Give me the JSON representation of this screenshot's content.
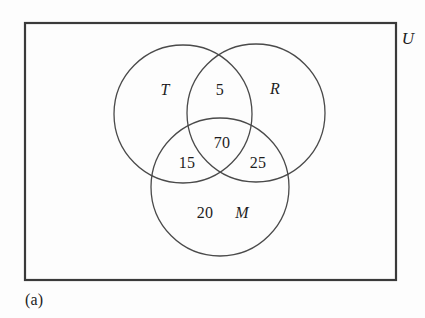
{
  "figure": {
    "caption": "(a)",
    "type": "venn-diagram-3-set",
    "stroke_color": "#3a3a3a",
    "text_color": "#1d1d1d",
    "background_color": "#fdfdfd"
  },
  "universe": {
    "label": "U",
    "rect": {
      "x": 25,
      "y": 23,
      "width": 371,
      "height": 257
    },
    "label_position": {
      "x": 408,
      "y": 38
    }
  },
  "sets": [
    {
      "key": "T",
      "label": "T",
      "circle": {
        "cx": 183,
        "cy": 114,
        "r": 69
      },
      "label_position": {
        "x": 165,
        "y": 90
      }
    },
    {
      "key": "R",
      "label": "R",
      "circle": {
        "cx": 256,
        "cy": 113,
        "r": 69
      },
      "label_position": {
        "x": 275,
        "y": 89
      }
    },
    {
      "key": "M",
      "label": "M",
      "circle": {
        "cx": 220,
        "cy": 187,
        "r": 69
      },
      "label_position": {
        "x": 242,
        "y": 213
      }
    }
  ],
  "regions": [
    {
      "key": "T_only_R",
      "label": "5",
      "region": "T ∩ R only",
      "position": {
        "x": 220,
        "y": 90
      }
    },
    {
      "key": "T_R_M",
      "label": "70",
      "region": "T ∩ R ∩ M",
      "position": {
        "x": 222,
        "y": 143
      }
    },
    {
      "key": "T_M",
      "label": "15",
      "region": "T ∩ M only",
      "position": {
        "x": 187,
        "y": 163
      }
    },
    {
      "key": "R_M",
      "label": "25",
      "region": "R ∩ M only",
      "position": {
        "x": 258,
        "y": 163
      }
    },
    {
      "key": "M_only",
      "label": "20",
      "region": "M only",
      "position": {
        "x": 205,
        "y": 213
      }
    }
  ],
  "chart_data": {
    "type": "venn",
    "title": "",
    "set_labels": [
      "T",
      "R",
      "M"
    ],
    "universe_label": "U",
    "caption": "(a)",
    "region_values": {
      "T∩R only": 5,
      "T∩R∩M": 70,
      "T∩M only": 15,
      "R∩M only": 25,
      "M only": 20
    },
    "values": [
      5,
      70,
      15,
      25,
      20
    ],
    "categories": [
      "T∩R only",
      "T∩R∩M",
      "T∩M only",
      "R∩M only",
      "M only"
    ]
  }
}
